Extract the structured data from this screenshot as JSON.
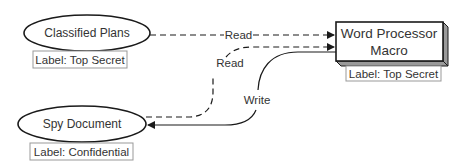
{
  "nodes": {
    "classified": {
      "title": "Classified Plans",
      "label": "Label: Top Secret"
    },
    "macro": {
      "title_line1": "Word Processor",
      "title_line2": "Macro",
      "label": "Label: Top Secret"
    },
    "spy": {
      "title": "Spy Document",
      "label": "Label: Confidential"
    }
  },
  "edges": {
    "read_classified": {
      "label": "Read",
      "style": "dashed"
    },
    "read_spy": {
      "label": "Read",
      "style": "dashed"
    },
    "write_spy": {
      "label": "Write",
      "style": "solid"
    }
  },
  "colors": {
    "stroke": "#1a1a1a",
    "label_border": "#999999",
    "shadow": "#9a9a9a"
  }
}
